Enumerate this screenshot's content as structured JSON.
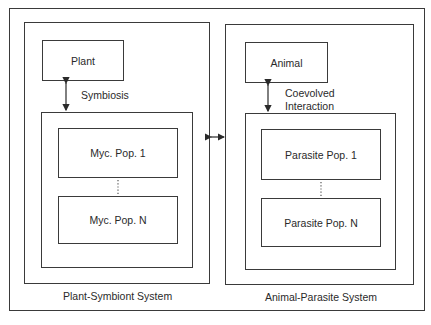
{
  "diagram": {
    "left_system": {
      "title": "Plant-Symbiont System",
      "host": "Plant",
      "interaction": "Symbiosis",
      "populations": [
        "Myc. Pop. 1",
        "Myc. Pop. N"
      ],
      "ellipsis": "⋮"
    },
    "right_system": {
      "title": "Animal-Parasite System",
      "host": "Animal",
      "interaction_line1": "Coevolved",
      "interaction_line2": "Interaction",
      "populations": [
        "Parasite  Pop. 1",
        "Parasite Pop. N"
      ],
      "ellipsis": "⋮"
    },
    "link": "bidirectional-arrow",
    "colors": {
      "line": "#3a3a3a",
      "text": "#2a2a2a",
      "background": "#ffffff"
    }
  }
}
